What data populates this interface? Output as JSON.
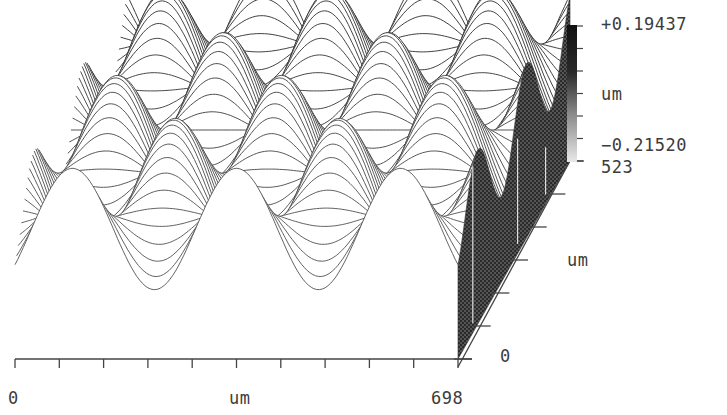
{
  "chart_data": {
    "type": "surface3d",
    "title": "",
    "x_axis": {
      "label": "um",
      "min": 0,
      "max": 698,
      "min_label": "0",
      "max_label": "698",
      "ticks": 11
    },
    "y_axis": {
      "label": "um",
      "min": 0,
      "max": 523,
      "min_label": "0",
      "max_label": "523",
      "ticks": 7
    },
    "z_axis": {
      "label": "um",
      "min": -0.2152,
      "max": 0.19437,
      "min_label": "-0.21520",
      "max_label": "+0.19437"
    },
    "colorbar": {
      "ticks": 7,
      "colors": [
        "#111111",
        "#e8e8e8"
      ]
    },
    "surface": {
      "periods_x": 2.7,
      "periods_y": 2.3,
      "phase_x": 0.15,
      "phase_y": 0.6,
      "trace_lines": 70,
      "samples_per_line": 160
    },
    "grid": false,
    "legend": "none"
  },
  "labels": {
    "z_max": "+0.19437",
    "z_unit": "um",
    "z_min": "−0.21520",
    "y_max": "523",
    "y_unit": "um",
    "y_min": "0",
    "x_min": "0",
    "x_unit": "um",
    "x_max": "698"
  }
}
